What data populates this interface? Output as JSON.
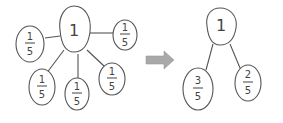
{
  "diagram": {
    "left_tree": {
      "root": "1",
      "children": [
        {
          "num": "1",
          "den": "5"
        },
        {
          "num": "1",
          "den": "5"
        },
        {
          "num": "1",
          "den": "5"
        },
        {
          "num": "1",
          "den": "5"
        },
        {
          "num": "1",
          "den": "5"
        }
      ]
    },
    "arrow": {
      "direction": "right",
      "color": "#a9a9a9"
    },
    "right_tree": {
      "root": "1",
      "children": [
        {
          "num": "3",
          "den": "5"
        },
        {
          "num": "2",
          "den": "5"
        }
      ]
    }
  }
}
